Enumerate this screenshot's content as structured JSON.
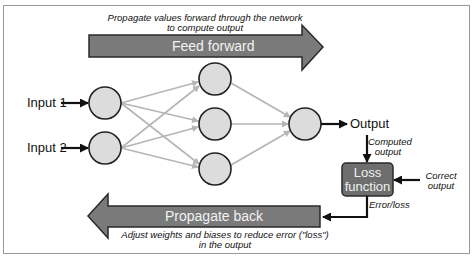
{
  "diagram": {
    "feed_forward": {
      "caption_line1": "Propagate values forward through the network",
      "caption_line2": "to compute output",
      "label": "Feed forward"
    },
    "inputs": [
      {
        "label": "Input 1"
      },
      {
        "label": "Input 2"
      }
    ],
    "layers": {
      "input_nodes": 2,
      "hidden_nodes": 3,
      "output_nodes": 1
    },
    "output": {
      "label": "Output"
    },
    "computed_output": {
      "line1": "Computed",
      "line2": "output"
    },
    "loss_box": {
      "line1": "Loss",
      "line2": "function"
    },
    "correct_output": {
      "line1": "Correct",
      "line2": "output"
    },
    "error_label": "Error/loss",
    "propagate_back": {
      "label": "Propagate back",
      "caption_line1": "Adjust weights and biases to reduce error (\"loss\")",
      "caption_line2": "in the output"
    },
    "colors": {
      "arrow_fill": "#777777",
      "node_fill": "#dcdcdc",
      "node_stroke": "#222222",
      "edge_color": "#b5b5b5",
      "loss_fill": "#6e6e6e"
    }
  }
}
